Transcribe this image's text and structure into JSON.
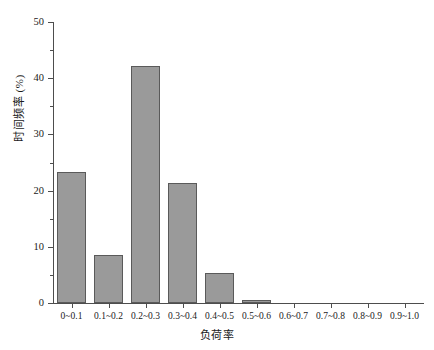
{
  "chart_data": {
    "type": "bar",
    "title": "",
    "xlabel": "负荷率",
    "ylabel": "时间频率 (%)",
    "categories": [
      "0~0.1",
      "0.1~0.2",
      "0.2~0.3",
      "0.3~0.4",
      "0.4~0.5",
      "0.5~0.6",
      "0.6~0.7",
      "0.7~0.8",
      "0.8~0.9",
      "0.9~1.0"
    ],
    "values": [
      23.3,
      8.5,
      42.2,
      21.4,
      5.3,
      0.5,
      0,
      0,
      0,
      0
    ],
    "ylim": [
      0,
      50
    ],
    "ytick_labels": [
      "0",
      "10",
      "20",
      "30",
      "40",
      "50"
    ],
    "ytick_values": [
      0,
      10,
      20,
      30,
      40,
      50
    ],
    "yminor_values": [
      5,
      15,
      25,
      35,
      45
    ],
    "grid": false,
    "legend": false,
    "bar_color": "#9a9a9a",
    "bar_edge_color": "#5a5a5a",
    "axis_color": "#4d4d4d"
  }
}
